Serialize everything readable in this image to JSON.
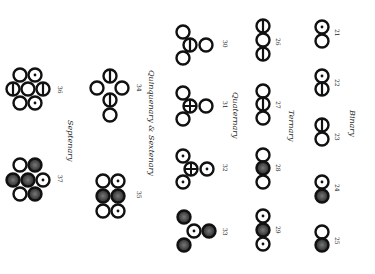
{
  "plate": {
    "title": "Compound atoms",
    "orientation": "rotated 90deg clockwise",
    "ink_color": "#111111",
    "shade_color": "#444444",
    "groups": [
      {
        "label": "Binary",
        "x": 352,
        "y": 132
      },
      {
        "label": "Ternary",
        "x": 292,
        "y": 132
      },
      {
        "label": "Quaternary",
        "x": 235,
        "y": 110
      },
      {
        "label": "Quinquenary & Sextenary",
        "x": 152,
        "y": 140
      },
      {
        "label": "Septenary",
        "x": 70,
        "y": 142
      }
    ],
    "figures": [
      {
        "num": "21",
        "group": "Binary"
      },
      {
        "num": "22",
        "group": "Binary"
      },
      {
        "num": "23",
        "group": "Binary"
      },
      {
        "num": "24",
        "group": "Binary"
      },
      {
        "num": "25",
        "group": "Binary"
      },
      {
        "num": "26",
        "group": "Ternary"
      },
      {
        "num": "27",
        "group": "Ternary"
      },
      {
        "num": "28",
        "group": "Ternary"
      },
      {
        "num": "29",
        "group": "Ternary"
      },
      {
        "num": "30",
        "group": "Quaternary"
      },
      {
        "num": "31",
        "group": "Quaternary"
      },
      {
        "num": "32",
        "group": "Quaternary"
      },
      {
        "num": "33",
        "group": "Quaternary"
      },
      {
        "num": "34",
        "group": "Quinquenary & Sextenary"
      },
      {
        "num": "35",
        "group": "Quinquenary & Sextenary"
      },
      {
        "num": "36",
        "group": "Septenary"
      },
      {
        "num": "37",
        "group": "Septenary"
      }
    ]
  }
}
